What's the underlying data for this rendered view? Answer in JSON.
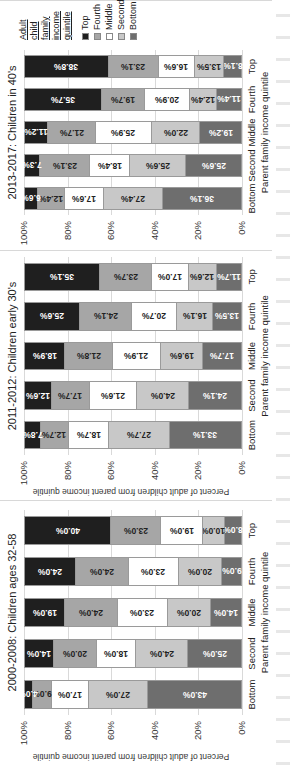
{
  "colors": {
    "Top": "#1f1f1f",
    "Fourth": "#a6a6a6",
    "Middle": "#ffffff",
    "Second": "#c8c8c8",
    "Bottom": "#6e6e6e"
  },
  "label_colors": {
    "Top": "#ffffff",
    "Fourth": "#222222",
    "Middle": "#222222",
    "Second": "#222222",
    "Bottom": "#ffffff"
  },
  "legend": {
    "title_lines": [
      "Adult",
      "child",
      "family",
      "income",
      "quintile"
    ],
    "items": [
      "Top",
      "Fourth",
      "Middle",
      "Second",
      "Bottom"
    ]
  },
  "chart_data": [
    {
      "type": "bar",
      "stacked": true,
      "title": "2000-2008: Children ages 32-58",
      "xlabel": "Parent family income quintile",
      "ylabel": "Percent of adult children from parent income quintile",
      "yticks": [
        "100%",
        "80%",
        "60%",
        "40%",
        "20%",
        "0%"
      ],
      "ylim": [
        0,
        100
      ],
      "categories": [
        "Bottom",
        "Second",
        "Middle",
        "Fourth",
        "Top"
      ],
      "series": [
        {
          "name": "Bottom",
          "values": [
            43.0,
            25.0,
            14.0,
            9.0,
            8.0
          ],
          "labels": [
            "43.0%",
            "25.0%",
            "14.0%",
            "9.0%",
            "8.0%"
          ]
        },
        {
          "name": "Second",
          "values": [
            27.0,
            24.0,
            20.0,
            20.0,
            10.0
          ],
          "labels": [
            "27.0%",
            "24.0%",
            "20.0%",
            "20.0%",
            "10.0%"
          ]
        },
        {
          "name": "Middle",
          "values": [
            17.0,
            18.0,
            23.0,
            23.0,
            19.0
          ],
          "labels": [
            "17.0%",
            "18.0%",
            "23.0%",
            "23.0%",
            "19.0%"
          ]
        },
        {
          "name": "Fourth",
          "values": [
            9.0,
            20.0,
            24.0,
            24.0,
            23.0
          ],
          "labels": [
            "9.0%",
            "20.0%",
            "24.0%",
            "24.0%",
            "23.0%"
          ]
        },
        {
          "name": "Top",
          "values": [
            4.0,
            14.0,
            19.0,
            24.0,
            40.0
          ],
          "labels": [
            "4.0%",
            "14.0%",
            "19.0%",
            "24.0%",
            "40.0%"
          ]
        }
      ]
    },
    {
      "type": "bar",
      "stacked": true,
      "title": "2011-2012: Children early 30's",
      "xlabel": "Parent family income quintile",
      "ylabel": "Percent of adult children from parent income quintile",
      "yticks": [
        "100%",
        "80%",
        "60%",
        "40%",
        "20%",
        "0%"
      ],
      "ylim": [
        0,
        100
      ],
      "categories": [
        "Bottom",
        "Second",
        "Middle",
        "Fourth",
        "Top"
      ],
      "series": [
        {
          "name": "Bottom",
          "values": [
            33.1,
            24.1,
            17.7,
            13.5,
            11.7
          ],
          "labels": [
            "33.1%",
            "24.1%",
            "17.7%",
            "13.5%",
            "11.7%"
          ]
        },
        {
          "name": "Second",
          "values": [
            27.7,
            24.0,
            19.6,
            16.1,
            12.6
          ],
          "labels": [
            "27.7%",
            "24.0%",
            "19.6%",
            "16.1%",
            "12.6%"
          ]
        },
        {
          "name": "Middle",
          "values": [
            18.7,
            21.6,
            21.9,
            20.7,
            17.0
          ],
          "labels": [
            "18.7%",
            "21.6%",
            "21.9%",
            "20.7%",
            "17.0%"
          ]
        },
        {
          "name": "Fourth",
          "values": [
            12.7,
            17.7,
            21.8,
            24.1,
            23.7
          ],
          "labels": [
            "12.7%",
            "17.7%",
            "21.8%",
            "24.1%",
            "23.7%"
          ]
        },
        {
          "name": "Top",
          "values": [
            7.8,
            12.6,
            18.9,
            25.6,
            35.1
          ],
          "labels": [
            "7.8%",
            "12.6%",
            "18.9%",
            "25.6%",
            "35.1%"
          ]
        }
      ]
    },
    {
      "type": "bar",
      "stacked": true,
      "title": "2013-2017: Children in 40's",
      "xlabel": "Parent family income quintile",
      "ylabel": "",
      "yticks": [
        "100%",
        "80%",
        "60%",
        "40%",
        "20%",
        "0%"
      ],
      "ylim": [
        0,
        100
      ],
      "categories": [
        "Bottom",
        "Second",
        "Middle",
        "Fourth",
        "Top"
      ],
      "series": [
        {
          "name": "Bottom",
          "values": [
            36.1,
            25.6,
            19.2,
            11.4,
            8.1
          ],
          "labels": [
            "36.1%",
            "25.6%",
            "19.2%",
            "11.4%",
            "8.1%"
          ]
        },
        {
          "name": "Second",
          "values": [
            27.4,
            25.6,
            22.0,
            12.4,
            13.5
          ],
          "labels": [
            "27.4%",
            "25.6%",
            "22.0%",
            "12.4%",
            "13.5%"
          ]
        },
        {
          "name": "Middle",
          "values": [
            17.6,
            18.4,
            25.9,
            20.9,
            16.6
          ],
          "labels": [
            "17.6%",
            "18.4%",
            "25.9%",
            "20.9%",
            "16.6%"
          ]
        },
        {
          "name": "Fourth",
          "values": [
            12.4,
            23.1,
            21.7,
            19.7,
            23.1
          ],
          "labels": [
            "12.4%",
            "23.1%",
            "21.7%",
            "19.7%",
            "23.1%"
          ]
        },
        {
          "name": "Top",
          "values": [
            6.6,
            7.3,
            11.2,
            35.7,
            38.8
          ],
          "labels": [
            "6.6%",
            "7.3%",
            "11.2%",
            "35.7%",
            "38.8%"
          ]
        }
      ]
    }
  ]
}
